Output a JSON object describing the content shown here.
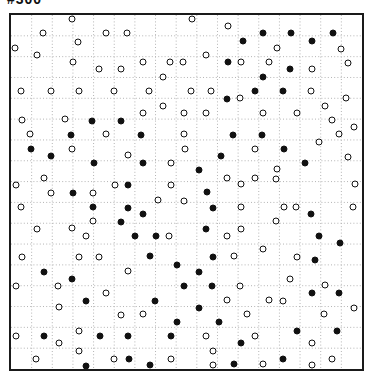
{
  "label": {
    "text": "#300"
  },
  "board": {
    "rows": 17,
    "cols": 17,
    "border_color": "#1a1a1a",
    "grid_line_color": "#b4b4b4",
    "background": "#ffffff"
  },
  "dots": {
    "white_fill": "#ffffff",
    "black_fill": "#111111",
    "outline_color": "#111111",
    "items": [
      [
        72,
        19,
        "w"
      ],
      [
        192,
        19,
        "w"
      ],
      [
        228,
        26,
        "w"
      ],
      [
        243,
        41,
        "b"
      ],
      [
        263,
        33,
        "b"
      ],
      [
        291,
        33,
        "b"
      ],
      [
        312,
        41,
        "b"
      ],
      [
        333,
        33,
        "b"
      ],
      [
        43,
        33,
        "w"
      ],
      [
        106,
        33,
        "w"
      ],
      [
        127,
        33,
        "w"
      ],
      [
        78,
        42,
        "w"
      ],
      [
        15,
        48,
        "w"
      ],
      [
        277,
        48,
        "w"
      ],
      [
        341,
        49,
        "w"
      ],
      [
        37,
        55,
        "w"
      ],
      [
        206,
        55,
        "w"
      ],
      [
        73,
        62,
        "w"
      ],
      [
        143,
        62,
        "w"
      ],
      [
        170,
        62,
        "w"
      ],
      [
        183,
        62,
        "w"
      ],
      [
        228,
        62,
        "b"
      ],
      [
        241,
        62,
        "w"
      ],
      [
        269,
        62,
        "w"
      ],
      [
        290,
        69,
        "b"
      ],
      [
        312,
        69,
        "w"
      ],
      [
        348,
        63,
        "w"
      ],
      [
        99,
        69,
        "w"
      ],
      [
        121,
        69,
        "w"
      ],
      [
        263,
        77,
        "b"
      ],
      [
        163,
        77,
        "w"
      ],
      [
        21,
        91,
        "w"
      ],
      [
        51,
        91,
        "w"
      ],
      [
        79,
        91,
        "w"
      ],
      [
        114,
        91,
        "w"
      ],
      [
        149,
        91,
        "w"
      ],
      [
        191,
        91,
        "w"
      ],
      [
        211,
        91,
        "w"
      ],
      [
        227,
        99,
        "b"
      ],
      [
        240,
        98,
        "w"
      ],
      [
        255,
        91,
        "b"
      ],
      [
        283,
        91,
        "b"
      ],
      [
        311,
        91,
        "w"
      ],
      [
        346,
        98,
        "w"
      ],
      [
        163,
        106,
        "w"
      ],
      [
        325,
        106,
        "w"
      ],
      [
        143,
        113,
        "w"
      ],
      [
        184,
        113,
        "w"
      ],
      [
        206,
        113,
        "w"
      ],
      [
        263,
        113,
        "w"
      ],
      [
        297,
        113,
        "w"
      ],
      [
        22,
        120,
        "w"
      ],
      [
        65,
        119,
        "w"
      ],
      [
        92,
        121,
        "b"
      ],
      [
        121,
        121,
        "b"
      ],
      [
        332,
        120,
        "w"
      ],
      [
        354,
        127,
        "w"
      ],
      [
        30,
        134,
        "w"
      ],
      [
        71,
        135,
        "b"
      ],
      [
        106,
        134,
        "w"
      ],
      [
        141,
        135,
        "b"
      ],
      [
        184,
        134,
        "w"
      ],
      [
        233,
        135,
        "b"
      ],
      [
        262,
        135,
        "b"
      ],
      [
        339,
        134,
        "w"
      ],
      [
        319,
        142,
        "w"
      ],
      [
        31,
        149,
        "b"
      ],
      [
        72,
        149,
        "w"
      ],
      [
        128,
        155,
        "w"
      ],
      [
        185,
        149,
        "w"
      ],
      [
        255,
        149,
        "w"
      ],
      [
        284,
        149,
        "b"
      ],
      [
        51,
        156,
        "b"
      ],
      [
        94,
        163,
        "b"
      ],
      [
        143,
        163,
        "b"
      ],
      [
        171,
        163,
        "w"
      ],
      [
        221,
        156,
        "b"
      ],
      [
        348,
        157,
        "w"
      ],
      [
        305,
        163,
        "b"
      ],
      [
        199,
        170,
        "b"
      ],
      [
        277,
        169,
        "w"
      ],
      [
        44,
        178,
        "w"
      ],
      [
        16,
        185,
        "w"
      ],
      [
        51,
        193,
        "w"
      ],
      [
        73,
        193,
        "b"
      ],
      [
        93,
        193,
        "w"
      ],
      [
        115,
        185,
        "w"
      ],
      [
        128,
        185,
        "b"
      ],
      [
        171,
        185,
        "w"
      ],
      [
        227,
        178,
        "w"
      ],
      [
        241,
        184,
        "w"
      ],
      [
        255,
        178,
        "w"
      ],
      [
        276,
        179,
        "w"
      ],
      [
        355,
        184,
        "w"
      ],
      [
        207,
        192,
        "b"
      ],
      [
        158,
        200,
        "w"
      ],
      [
        184,
        201,
        "w"
      ],
      [
        21,
        207,
        "w"
      ],
      [
        93,
        207,
        "b"
      ],
      [
        128,
        208,
        "b"
      ],
      [
        213,
        208,
        "b"
      ],
      [
        241,
        207,
        "w"
      ],
      [
        284,
        207,
        "w"
      ],
      [
        296,
        207,
        "w"
      ],
      [
        353,
        207,
        "w"
      ],
      [
        143,
        214,
        "b"
      ],
      [
        93,
        221,
        "w"
      ],
      [
        121,
        222,
        "b"
      ],
      [
        276,
        221,
        "w"
      ],
      [
        311,
        214,
        "b"
      ],
      [
        37,
        229,
        "w"
      ],
      [
        72,
        228,
        "w"
      ],
      [
        86,
        236,
        "w"
      ],
      [
        135,
        236,
        "b"
      ],
      [
        156,
        236,
        "b"
      ],
      [
        169,
        236,
        "w"
      ],
      [
        206,
        229,
        "b"
      ],
      [
        227,
        236,
        "w"
      ],
      [
        241,
        229,
        "w"
      ],
      [
        319,
        236,
        "b"
      ],
      [
        340,
        243,
        "b"
      ],
      [
        263,
        249,
        "w"
      ],
      [
        22,
        257,
        "w"
      ],
      [
        79,
        257,
        "w"
      ],
      [
        99,
        257,
        "w"
      ],
      [
        150,
        256,
        "b"
      ],
      [
        213,
        257,
        "b"
      ],
      [
        234,
        256,
        "w"
      ],
      [
        297,
        257,
        "w"
      ],
      [
        315,
        260,
        "b"
      ],
      [
        177,
        265,
        "b"
      ],
      [
        44,
        272,
        "b"
      ],
      [
        128,
        271,
        "w"
      ],
      [
        199,
        272,
        "b"
      ],
      [
        72,
        279,
        "b"
      ],
      [
        16,
        286,
        "w"
      ],
      [
        58,
        286,
        "w"
      ],
      [
        106,
        293,
        "w"
      ],
      [
        184,
        286,
        "b"
      ],
      [
        212,
        286,
        "b"
      ],
      [
        240,
        286,
        "w"
      ],
      [
        290,
        279,
        "w"
      ],
      [
        325,
        285,
        "w"
      ],
      [
        312,
        293,
        "b"
      ],
      [
        339,
        293,
        "b"
      ],
      [
        86,
        301,
        "b"
      ],
      [
        155,
        301,
        "b"
      ],
      [
        227,
        300,
        "w"
      ],
      [
        269,
        300,
        "w"
      ],
      [
        283,
        301,
        "w"
      ],
      [
        59,
        307,
        "w"
      ],
      [
        199,
        308,
        "b"
      ],
      [
        121,
        315,
        "w"
      ],
      [
        143,
        314,
        "w"
      ],
      [
        247,
        314,
        "w"
      ],
      [
        324,
        314,
        "w"
      ],
      [
        354,
        308,
        "w"
      ],
      [
        177,
        322,
        "b"
      ],
      [
        219,
        322,
        "b"
      ],
      [
        16,
        336,
        "w"
      ],
      [
        44,
        336,
        "b"
      ],
      [
        59,
        343,
        "w"
      ],
      [
        79,
        331,
        "w"
      ],
      [
        100,
        336,
        "b"
      ],
      [
        128,
        336,
        "b"
      ],
      [
        171,
        336,
        "b"
      ],
      [
        206,
        336,
        "w"
      ],
      [
        241,
        343,
        "b"
      ],
      [
        255,
        336,
        "w"
      ],
      [
        297,
        331,
        "b"
      ],
      [
        337,
        331,
        "b"
      ],
      [
        79,
        351,
        "w"
      ],
      [
        36,
        359,
        "w"
      ],
      [
        86,
        366,
        "b"
      ],
      [
        114,
        359,
        "w"
      ],
      [
        129,
        359,
        "b"
      ],
      [
        150,
        365,
        "b"
      ],
      [
        171,
        359,
        "w"
      ],
      [
        213,
        351,
        "w"
      ],
      [
        213,
        365,
        "w"
      ],
      [
        234,
        364,
        "b"
      ],
      [
        263,
        364,
        "w"
      ],
      [
        283,
        359,
        "b"
      ],
      [
        312,
        343,
        "w"
      ],
      [
        312,
        365,
        "w"
      ],
      [
        332,
        359,
        "w"
      ]
    ]
  }
}
